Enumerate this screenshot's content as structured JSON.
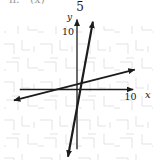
{
  "labels": {
    "top_number": "5",
    "top_left_fragment_1": "h.",
    "top_left_fragment_2": "(x)",
    "y_axis": "y",
    "x_axis": "x",
    "y_tick": "10",
    "x_tick": "10"
  },
  "colors": {
    "ink": "#1c1c1c",
    "watermark": "#e3e3e3",
    "background": "#ffffff"
  },
  "chart_data": {
    "type": "line",
    "title": "",
    "xlabel": "x",
    "ylabel": "y",
    "xlim": [
      -10.8,
      10.6
    ],
    "ylim": [
      -10.5,
      12.3
    ],
    "x_tick_labels": [
      10
    ],
    "y_tick_labels": [
      10
    ],
    "grid": "faint watermark fragments only",
    "axes_arrows": {
      "x": "right",
      "y": "top"
    },
    "series": [
      {
        "name": "steep-line",
        "slope": 5,
        "y_intercept": -3.2,
        "endpoints": [
          [
            -1.7,
            -11.8
          ],
          [
            3.0,
            11.9
          ]
        ],
        "arrows": "both"
      },
      {
        "name": "shallow-line",
        "slope": 0.24,
        "y_intercept": 0.9,
        "endpoints": [
          [
            -11.9,
            -1.9
          ],
          [
            10.9,
            3.5
          ]
        ],
        "arrows": "both"
      }
    ]
  }
}
